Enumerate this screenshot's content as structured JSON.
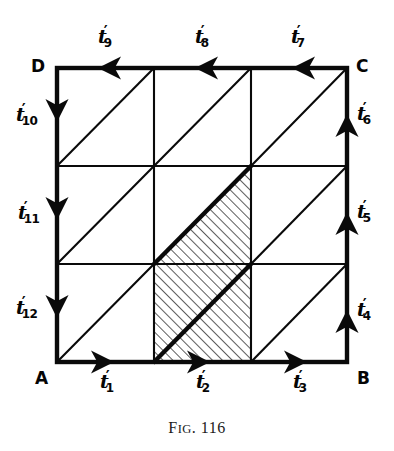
{
  "figure": {
    "caption_prefix": "F",
    "caption_smallcaps": "IG",
    "caption_rest": ". 116",
    "caption_full": "Fig. 116",
    "corners": {
      "a": "A",
      "b": "B",
      "c": "C",
      "d": "D"
    },
    "edge_labels": {
      "bottom": [
        {
          "base": "t",
          "prime": "′",
          "sub": "1"
        },
        {
          "base": "t",
          "prime": "′",
          "sub": "2"
        },
        {
          "base": "t",
          "prime": "′",
          "sub": "3"
        }
      ],
      "right": [
        {
          "base": "t",
          "prime": "′",
          "sub": "4"
        },
        {
          "base": "t",
          "prime": "′",
          "sub": "5"
        },
        {
          "base": "t",
          "prime": "′",
          "sub": "6"
        }
      ],
      "top": [
        {
          "base": "t",
          "prime": "′",
          "sub": "7"
        },
        {
          "base": "t",
          "prime": "′",
          "sub": "8"
        },
        {
          "base": "t",
          "prime": "′",
          "sub": "9"
        }
      ],
      "left": [
        {
          "base": "t",
          "prime": "′",
          "sub": "10"
        },
        {
          "base": "t",
          "prime": "′",
          "sub": "11"
        },
        {
          "base": "t",
          "prime": "′",
          "sub": "12"
        }
      ]
    },
    "colors": {
      "ink": "#0a0a0a",
      "paper": "#ffffff",
      "hatch": "#2b2b2b"
    },
    "geometry": {
      "square": {
        "left": 57,
        "top": 68,
        "right": 347,
        "bottom": 362
      },
      "x_grid": [
        57,
        154,
        251,
        347
      ],
      "y_grid": [
        68,
        166,
        264,
        362
      ],
      "cells": 9,
      "diagonal_direction": "bottom-left to top-right",
      "shaded_region_vertices": [
        [
          154,
          264
        ],
        [
          251,
          166
        ],
        [
          251,
          362
        ],
        [
          154,
          362
        ]
      ],
      "bold_diagonals": [
        [
          154,
          264,
          251,
          166
        ],
        [
          154,
          362,
          251,
          264
        ]
      ]
    },
    "arrow_directions": {
      "bottom": "right",
      "right": "up",
      "top": "left",
      "left": "down"
    }
  }
}
